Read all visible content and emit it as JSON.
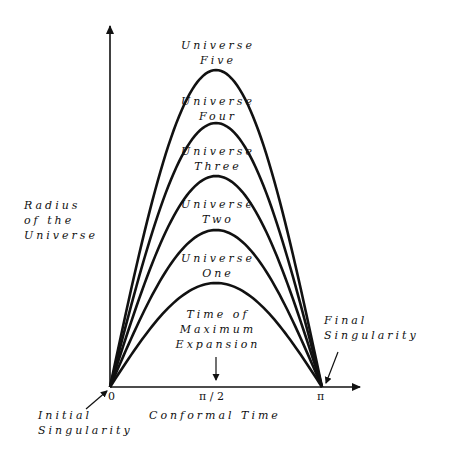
{
  "diagram": {
    "title": "",
    "universes": [
      {
        "line1": "Universe",
        "line2": "One",
        "peak_y": 283
      },
      {
        "line1": "Universe",
        "line2": "Two",
        "peak_y": 230
      },
      {
        "line1": "Universe",
        "line2": "Three",
        "peak_y": 176
      },
      {
        "line1": "Universe",
        "line2": "Four",
        "peak_y": 123
      },
      {
        "line1": "Universe",
        "line2": "Five",
        "peak_y": 70
      }
    ],
    "y_axis_label": {
      "line1": "Radius",
      "line2": "of the",
      "line3": "Universe"
    },
    "x_axis_label": "Conformal Time",
    "x_ticks": {
      "zero": "0",
      "half_pi": "π / 2",
      "pi": "π"
    },
    "annotations": {
      "max_expansion": {
        "line1": "Time of",
        "line2": "Maximum",
        "line3": "Expansion"
      },
      "final_singularity": {
        "line1": "Final",
        "line2": "Singularity"
      },
      "initial_singularity": {
        "line1": "Initial",
        "line2": "Singularity"
      }
    },
    "colors": {
      "ink": "#111111",
      "background": "#ffffff"
    }
  }
}
